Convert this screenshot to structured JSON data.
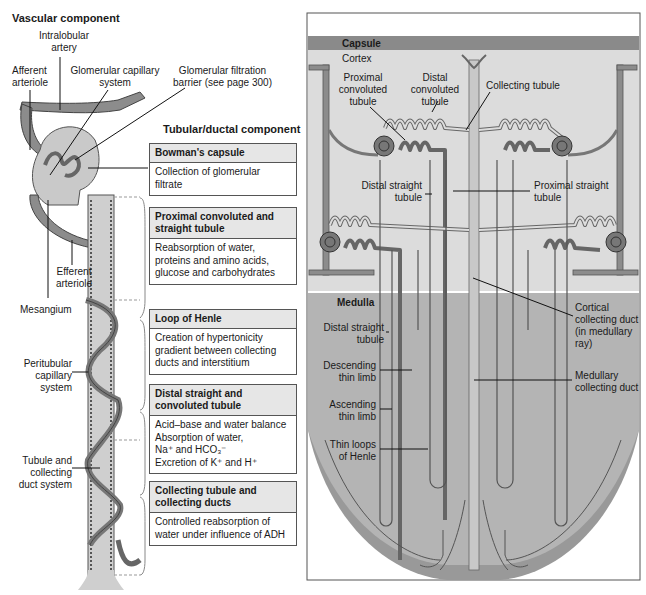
{
  "left_panel": {
    "vascular_heading": "Vascular component",
    "tubular_heading": "Tubular/ductal component",
    "labels": {
      "intralobular_artery": [
        "Intralobular",
        "artery"
      ],
      "afferent_arteriole": [
        "Afferent",
        "arteriole"
      ],
      "glomerular_capillary_system": [
        "Glomerular capillary",
        "system"
      ],
      "glomerular_filtration_barrier": [
        "Glomerular filtration",
        "barrier (see page 300)"
      ],
      "efferent_arteriole": [
        "Efferent",
        "arteriole"
      ],
      "mesangium": "Mesangium",
      "peritubular_capillary_system": [
        "Peritubular",
        "capillary",
        "system"
      ],
      "tubule_and_collecting_duct": [
        "Tubule and",
        "collecting",
        "duct system"
      ]
    },
    "cards": [
      {
        "title": [
          "Bowman's capsule"
        ],
        "body": [
          "Collection of glomerular",
          "filtrate"
        ]
      },
      {
        "title": [
          "Proximal convoluted and",
          "straight tubule"
        ],
        "body": [
          "Reabsorption of water,",
          "proteins and amino acids,",
          "glucose and carbohydrates"
        ]
      },
      {
        "title": [
          "Loop of Henle"
        ],
        "body": [
          "Creation of hypertonicity",
          "gradient between collecting",
          "ducts and interstitium"
        ]
      },
      {
        "title": [
          "Distal straight and",
          "convoluted tubule"
        ],
        "body": [
          "Acid–base and water balance",
          "Absorption of water,",
          "Na⁺ and HCO₃⁻",
          "Excretion of K⁺ and H⁺"
        ]
      },
      {
        "title": [
          "Collecting tubule and",
          "collecting ducts"
        ],
        "body": [
          "Controlled reabsorption of",
          "water under influence of ADH"
        ]
      }
    ]
  },
  "right_panel": {
    "zones": {
      "capsule": "Capsule",
      "cortex": "Cortex",
      "medulla": "Medulla"
    },
    "labels": {
      "proximal_convoluted_tubule": [
        "Proximal",
        "convoluted",
        "tubule"
      ],
      "distal_convoluted_tubule": [
        "Distal",
        "convoluted",
        "tubule"
      ],
      "collecting_tubule": "Collecting tubule",
      "distal_straight_tubule_cortex": [
        "Distal straight",
        "tubule"
      ],
      "proximal_straight_tubule": [
        "Proximal straight",
        "tubule"
      ],
      "distal_straight_tubule_medulla": [
        "Distal straight",
        "tubule"
      ],
      "descending_thin_limb": [
        "Descending",
        "thin limb"
      ],
      "ascending_thin_limb": [
        "Ascending",
        "thin limb"
      ],
      "thin_loops_of_henle": [
        "Thin loops",
        "of Henle"
      ],
      "cortical_collecting_duct": [
        "Cortical",
        "collecting duct",
        "(in medullary",
        "ray)"
      ],
      "medullary_collecting_duct": [
        "Medullary",
        "collecting duct"
      ]
    },
    "colors": {
      "capsule_band": "#8a8a8a",
      "cortex_bg": "#dcdcdc",
      "medulla_bg": "#b4b4b4",
      "medulla_rim": "#999999",
      "tubule_stroke": "#555555",
      "collecting_duct": "#c8c8c8"
    }
  }
}
